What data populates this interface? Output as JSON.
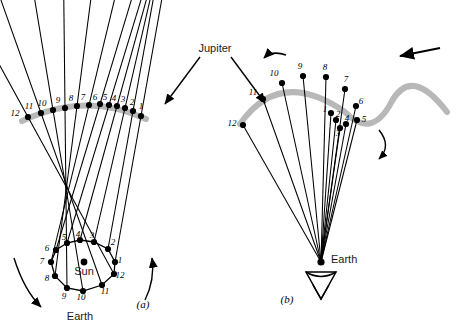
{
  "figure": {
    "title_label": "Jupiter",
    "panels": [
      {
        "id": "a",
        "caption": "(a)",
        "center_label": "Sun",
        "orbit_label": "Earth"
      },
      {
        "id": "b",
        "caption": "(b)",
        "observer_label": "Earth"
      }
    ],
    "numbers": [
      "1",
      "2",
      "3",
      "4",
      "5",
      "6",
      "7",
      "8",
      "9",
      "10",
      "11",
      "12"
    ],
    "colors": {
      "line": "#000000",
      "arc": "#b0b0b0",
      "text": "#000000",
      "label_text": "#1a1a1a",
      "background": "#ffffff"
    }
  },
  "panel_a": {
    "jupiter_positions": [
      {
        "n": "12",
        "x": 28,
        "y": 117,
        "lx": 15,
        "ly": 116
      },
      {
        "n": "11",
        "x": 41,
        "y": 113,
        "lx": 29,
        "ly": 109
      },
      {
        "n": "10",
        "x": 53,
        "y": 110,
        "lx": 42,
        "ly": 106
      },
      {
        "n": "9",
        "x": 65,
        "y": 108,
        "lx": 58,
        "ly": 103
      },
      {
        "n": "8",
        "x": 77,
        "y": 106,
        "lx": 71,
        "ly": 101
      },
      {
        "n": "7",
        "x": 89,
        "y": 105,
        "lx": 83,
        "ly": 100
      },
      {
        "n": "6",
        "x": 100,
        "y": 104,
        "lx": 95,
        "ly": 100
      },
      {
        "n": "5",
        "x": 109,
        "y": 105,
        "lx": 105,
        "ly": 100
      },
      {
        "n": "4",
        "x": 117,
        "y": 106,
        "lx": 114,
        "ly": 101
      },
      {
        "n": "3",
        "x": 125,
        "y": 108,
        "lx": 123,
        "ly": 102
      },
      {
        "n": "2",
        "x": 133,
        "y": 111,
        "lx": 132,
        "ly": 105
      },
      {
        "n": "1",
        "x": 141,
        "y": 116,
        "lx": 141,
        "ly": 109
      }
    ],
    "earth_positions": [
      {
        "n": "1",
        "x": 115,
        "y": 262,
        "lx": 120,
        "ly": 263
      },
      {
        "n": "2",
        "x": 108,
        "y": 249,
        "lx": 113,
        "ly": 245
      },
      {
        "n": "3",
        "x": 94,
        "y": 242,
        "lx": 92,
        "ly": 238
      },
      {
        "n": "4",
        "x": 80,
        "y": 240,
        "lx": 78,
        "ly": 237
      },
      {
        "n": "5",
        "x": 67,
        "y": 243,
        "lx": 64,
        "ly": 240
      },
      {
        "n": "6",
        "x": 56,
        "y": 250,
        "lx": 47,
        "ly": 251
      },
      {
        "n": "7",
        "x": 51,
        "y": 262,
        "lx": 42,
        "ly": 264
      },
      {
        "n": "8",
        "x": 55,
        "y": 276,
        "lx": 47,
        "ly": 281
      },
      {
        "n": "9",
        "x": 67,
        "y": 288,
        "lx": 64,
        "ly": 299
      },
      {
        "n": "10",
        "x": 83,
        "y": 291,
        "lx": 81,
        "ly": 300
      },
      {
        "n": "11",
        "x": 102,
        "y": 285,
        "lx": 105,
        "ly": 294
      },
      {
        "n": "12",
        "x": 114,
        "y": 274,
        "lx": 120,
        "ly": 278
      }
    ],
    "sun": {
      "x": 84,
      "y": 262
    },
    "sun_label_pos": {
      "x": 84,
      "y": 275
    },
    "earth_label_pos": {
      "x": 80,
      "y": 320
    },
    "caption_pos": {
      "x": 143,
      "y": 308
    },
    "arc": "M 22,121 Q 86,91 146,119"
  },
  "panel_b": {
    "observer": {
      "x": 321,
      "y": 262
    },
    "earth_label_pos": {
      "x": 331,
      "y": 263
    },
    "caption_pos": {
      "x": 287,
      "y": 303
    },
    "arc": "M 240,124 Q 280,67 345,112 Q 372,140 392,101 Q 412,66 447,112",
    "jupiter_positions": [
      {
        "n": "12",
        "x": 243,
        "y": 125,
        "lx": 232,
        "ly": 126
      },
      {
        "n": "11",
        "x": 263,
        "y": 99,
        "lx": 253,
        "ly": 95
      },
      {
        "n": "10",
        "x": 282,
        "y": 83,
        "lx": 274,
        "ly": 76
      },
      {
        "n": "9",
        "x": 303,
        "y": 76,
        "lx": 300,
        "ly": 69
      },
      {
        "n": "8",
        "x": 326,
        "y": 77,
        "lx": 325,
        "ly": 70
      },
      {
        "n": "7",
        "x": 345,
        "y": 89,
        "lx": 346,
        "ly": 82
      },
      {
        "n": "6",
        "x": 356,
        "y": 106,
        "lx": 361,
        "ly": 104
      },
      {
        "n": "5",
        "x": 357,
        "y": 120,
        "lx": 364,
        "ly": 122
      },
      {
        "n": "4",
        "x": 346,
        "y": 124,
        "lx": 347,
        "ly": 121
      },
      {
        "n": "3",
        "x": 340,
        "y": 128,
        "lx": 338,
        "ly": 136
      },
      {
        "n": "2",
        "x": 336,
        "y": 120,
        "lx": 338,
        "ly": 117
      },
      {
        "n": "1",
        "x": 331,
        "y": 113,
        "lx": 325,
        "ly": 112
      }
    ]
  },
  "annotations": {
    "jupiter_label_pos": {
      "x": 215,
      "y": 52
    },
    "arrow_left": "M 200,57 L 165,104",
    "arrow_right": "M 231,57 L 265,103",
    "orbit_arrow_left": "M 14,258 Q 24,290 41,307",
    "orbit_arrow_right": "M 145,300 Q 155,280 152,258",
    "retro_arrow_small": "M 286,55 Q 272,50 264,58",
    "retro_arrow_loop": "M 379,130 Q 392,146 379,159",
    "motion_arrow_top": "M 440,48 L 400,56"
  }
}
